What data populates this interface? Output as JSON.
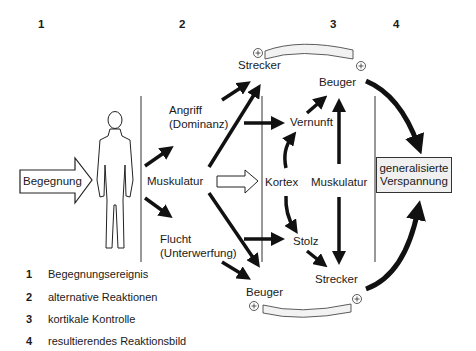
{
  "stage_numbers": [
    "1",
    "2",
    "3",
    "4"
  ],
  "labels": {
    "begegnung": "Begegnung",
    "angriff": "Angriff",
    "dominanz": "(Dominanz)",
    "muskulatur_left": "Muskulatur",
    "flucht": "Flucht",
    "unterwerfung": "(Unterwerfung)",
    "strecker_top": "Strecker",
    "beuger_top": "Beuger",
    "vernunft": "Vernunft",
    "kortex": "Kortex",
    "muskulatur_right": "Muskulatur",
    "stolz": "Stolz",
    "strecker_bottom": "Strecker",
    "beuger_bottom": "Beuger",
    "result_line1": "generalisierte",
    "result_line2": "Verspannung"
  },
  "legend": [
    {
      "num": "1",
      "text": "Begegnungsereignis"
    },
    {
      "num": "2",
      "text": "alternative Reaktionen"
    },
    {
      "num": "3",
      "text": "kortikale Kontrolle"
    },
    {
      "num": "4",
      "text": "resultierendes Reaktionsbild"
    }
  ],
  "colors": {
    "ink": "#1a1a1a",
    "box_fill": "#f0f0f0"
  }
}
